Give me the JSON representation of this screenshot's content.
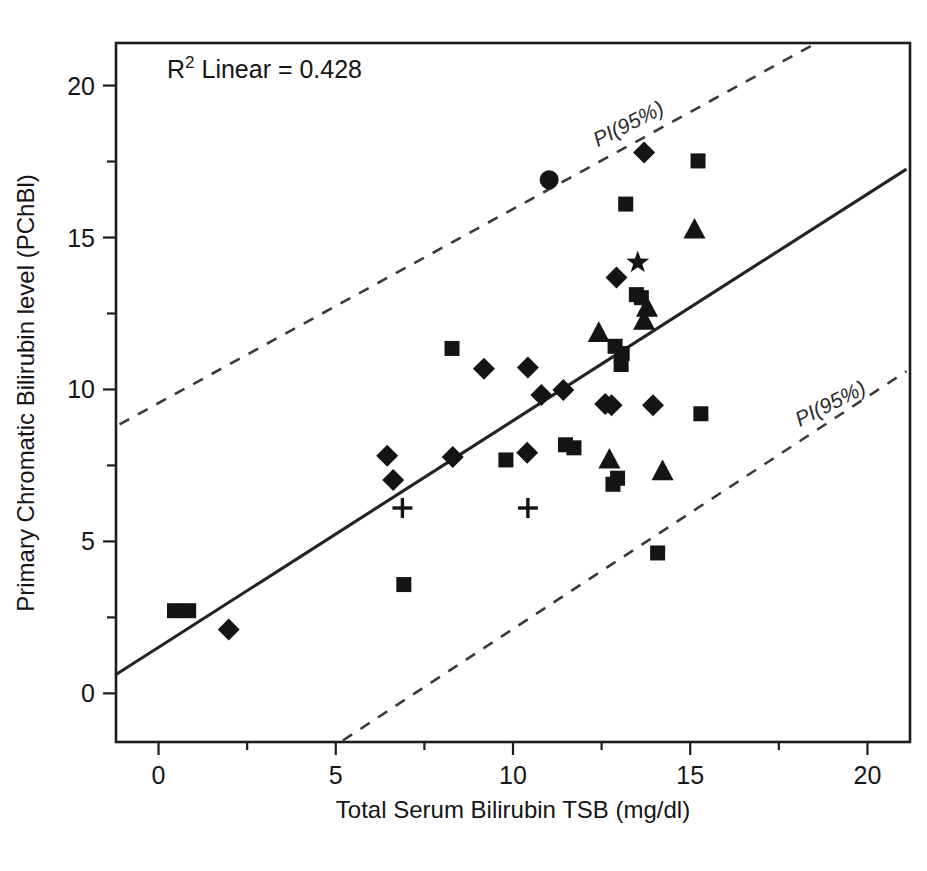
{
  "chart_data": {
    "type": "scatter",
    "title": "",
    "xlabel": "Total Serum Bilirubin TSB (mg/dl)",
    "ylabel": "Primary Chromatic Bilirubin level (PChBl)",
    "xlim": [
      -1.2,
      21.2
    ],
    "ylim": [
      -1.6,
      21.4
    ],
    "xticks": [
      0,
      5,
      10,
      15,
      20
    ],
    "xticklabels": [
      "0",
      "5",
      "10",
      "15",
      "20"
    ],
    "xminor": [
      2.5,
      7.5,
      12.5,
      17.5
    ],
    "yticks": [
      0,
      5,
      10,
      15,
      20
    ],
    "yticklabels": [
      "0",
      "5",
      "10",
      "15",
      "20"
    ],
    "yminor": [
      2.5,
      7.5,
      12.5,
      17.5
    ],
    "grid": false,
    "legend": "none",
    "annotations": [
      {
        "name": "r-squared",
        "text_prefix": "R",
        "text_sup": "2",
        "text_suffix": " Linear = 0.428",
        "value": 0.428,
        "x": 1.0,
        "y": 19.6
      },
      {
        "name": "pi-upper-label",
        "text": "PI(95%)",
        "x": 14.3,
        "y": 19.1,
        "rotation": -27
      },
      {
        "name": "pi-lower-label",
        "text": "PI(95%)",
        "x": 20.0,
        "y": 9.9,
        "rotation": -27
      }
    ],
    "fit_line": {
      "name": "linear-fit",
      "x": [
        -1.2,
        21.1
      ],
      "y": [
        0.62,
        17.25
      ],
      "style": "solid"
    },
    "prediction_intervals": [
      {
        "name": "pi-upper",
        "x": [
          -1.1,
          18.4
        ],
        "y": [
          8.85,
          21.3
        ],
        "style": "dashed"
      },
      {
        "name": "pi-lower",
        "x": [
          5.2,
          21.1
        ],
        "y": [
          -1.55,
          10.6
        ],
        "style": "dashed"
      }
    ],
    "points": [
      {
        "x": 0.45,
        "y": 2.72,
        "marker": "square"
      },
      {
        "x": 0.85,
        "y": 2.72,
        "marker": "square"
      },
      {
        "x": 1.98,
        "y": 2.1,
        "marker": "diamond"
      },
      {
        "x": 6.45,
        "y": 7.82,
        "marker": "diamond"
      },
      {
        "x": 6.62,
        "y": 7.02,
        "marker": "diamond"
      },
      {
        "x": 6.88,
        "y": 6.1,
        "marker": "plus"
      },
      {
        "x": 6.92,
        "y": 3.58,
        "marker": "square"
      },
      {
        "x": 8.28,
        "y": 11.35,
        "marker": "square"
      },
      {
        "x": 8.3,
        "y": 7.78,
        "marker": "diamond"
      },
      {
        "x": 9.18,
        "y": 10.68,
        "marker": "diamond"
      },
      {
        "x": 9.8,
        "y": 7.68,
        "marker": "square"
      },
      {
        "x": 10.42,
        "y": 10.72,
        "marker": "diamond"
      },
      {
        "x": 10.4,
        "y": 7.92,
        "marker": "diamond"
      },
      {
        "x": 10.42,
        "y": 6.1,
        "marker": "plus"
      },
      {
        "x": 10.8,
        "y": 9.82,
        "marker": "diamond"
      },
      {
        "x": 11.02,
        "y": 16.9,
        "marker": "circle"
      },
      {
        "x": 11.42,
        "y": 9.98,
        "marker": "diamond"
      },
      {
        "x": 11.48,
        "y": 8.18,
        "marker": "square"
      },
      {
        "x": 11.72,
        "y": 8.08,
        "marker": "square"
      },
      {
        "x": 12.42,
        "y": 11.85,
        "marker": "triangle"
      },
      {
        "x": 12.6,
        "y": 9.52,
        "marker": "diamond"
      },
      {
        "x": 12.78,
        "y": 9.48,
        "marker": "diamond"
      },
      {
        "x": 12.72,
        "y": 7.68,
        "marker": "triangle"
      },
      {
        "x": 12.82,
        "y": 6.88,
        "marker": "square"
      },
      {
        "x": 12.95,
        "y": 7.08,
        "marker": "square"
      },
      {
        "x": 12.88,
        "y": 11.42,
        "marker": "square"
      },
      {
        "x": 13.08,
        "y": 11.18,
        "marker": "square"
      },
      {
        "x": 13.05,
        "y": 10.82,
        "marker": "square"
      },
      {
        "x": 12.92,
        "y": 13.68,
        "marker": "diamond"
      },
      {
        "x": 13.18,
        "y": 16.1,
        "marker": "square"
      },
      {
        "x": 13.52,
        "y": 14.18,
        "marker": "star"
      },
      {
        "x": 13.48,
        "y": 13.12,
        "marker": "square"
      },
      {
        "x": 13.62,
        "y": 13.02,
        "marker": "square"
      },
      {
        "x": 13.7,
        "y": 17.8,
        "marker": "diamond"
      },
      {
        "x": 13.78,
        "y": 12.68,
        "marker": "triangle"
      },
      {
        "x": 13.7,
        "y": 12.25,
        "marker": "triangle"
      },
      {
        "x": 13.95,
        "y": 9.48,
        "marker": "diamond"
      },
      {
        "x": 14.08,
        "y": 4.62,
        "marker": "square"
      },
      {
        "x": 14.22,
        "y": 7.3,
        "marker": "triangle"
      },
      {
        "x": 15.12,
        "y": 15.25,
        "marker": "triangle"
      },
      {
        "x": 15.22,
        "y": 17.52,
        "marker": "square"
      },
      {
        "x": 15.3,
        "y": 9.2,
        "marker": "square"
      }
    ]
  },
  "colors": {
    "marker": "#141414",
    "axis": "#1c1c1c",
    "fit_line": "#232323",
    "pi_line": "#3a3a3a",
    "background": "#ffffff"
  }
}
